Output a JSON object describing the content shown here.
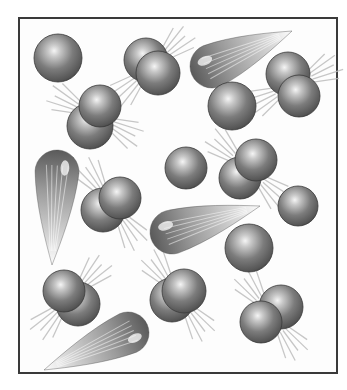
{
  "figure": {
    "frame": {
      "x": 18,
      "y": 17,
      "width": 320,
      "height": 357,
      "border_color": "#3a3a3a"
    },
    "colors": {
      "sphere_dark": "#4a4a4a",
      "sphere_mid": "#7a7a7a",
      "sphere_highlight": "#f2f2f2",
      "motion_line": "#b8b8b8"
    },
    "atoms": [
      {
        "x": 58,
        "y": 58,
        "r": 24
      },
      {
        "x": 232,
        "y": 106,
        "r": 24
      },
      {
        "x": 186,
        "y": 168,
        "r": 21
      },
      {
        "x": 249,
        "y": 248,
        "r": 24
      },
      {
        "x": 298,
        "y": 206,
        "r": 20
      }
    ],
    "molecules": [
      {
        "a": {
          "x": 146,
          "y": 60,
          "r": 22
        },
        "b": {
          "x": 158,
          "y": 73,
          "r": 22
        }
      },
      {
        "a": {
          "x": 90,
          "y": 126,
          "r": 23
        },
        "b": {
          "x": 100,
          "y": 106,
          "r": 21
        }
      },
      {
        "a": {
          "x": 288,
          "y": 74,
          "r": 22
        },
        "b": {
          "x": 299,
          "y": 96,
          "r": 21
        }
      },
      {
        "a": {
          "x": 240,
          "y": 178,
          "r": 21
        },
        "b": {
          "x": 256,
          "y": 160,
          "r": 21
        }
      },
      {
        "a": {
          "x": 103,
          "y": 210,
          "r": 22
        },
        "b": {
          "x": 120,
          "y": 198,
          "r": 21
        }
      },
      {
        "a": {
          "x": 78,
          "y": 304,
          "r": 22
        },
        "b": {
          "x": 64,
          "y": 291,
          "r": 21
        }
      },
      {
        "a": {
          "x": 172,
          "y": 300,
          "r": 22
        },
        "b": {
          "x": 184,
          "y": 291,
          "r": 22
        }
      },
      {
        "a": {
          "x": 281,
          "y": 307,
          "r": 22
        },
        "b": {
          "x": 261,
          "y": 322,
          "r": 21
        }
      }
    ],
    "streaks": [
      {
        "head_x": 212,
        "head_y": 66,
        "r": 22,
        "tail_x": 292,
        "tail_y": 31
      },
      {
        "head_x": 57,
        "head_y": 172,
        "r": 22,
        "tail_x": 52,
        "tail_y": 265
      },
      {
        "head_x": 172,
        "head_y": 232,
        "r": 22,
        "tail_x": 260,
        "tail_y": 206
      },
      {
        "head_x": 128,
        "head_y": 333,
        "r": 21,
        "tail_x": 44,
        "tail_y": 370
      }
    ]
  }
}
